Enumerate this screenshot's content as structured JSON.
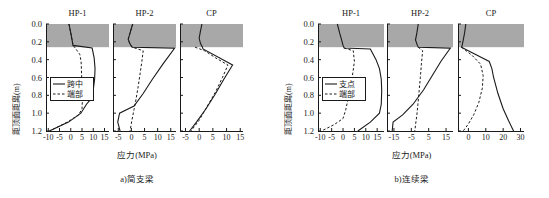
{
  "figure": {
    "ylabel": "距顶面距离(m)",
    "xlabel": "应力(MPa)",
    "y_ticks": [
      "0.0",
      "0.2",
      "0.4",
      "0.6",
      "0.8",
      "1.0",
      "1.2"
    ],
    "band_color": "#a8a8a8",
    "line_color": "#1a1a1a"
  },
  "groups": [
    {
      "caption": "a)简支梁",
      "legend": {
        "solid": "跨中",
        "dashed": "端部"
      },
      "panels": [
        {
          "title": "HP-1",
          "xticks": [
            "-10",
            "-5",
            "0",
            "5",
            "10",
            "15"
          ]
        },
        {
          "title": "HP-2",
          "xticks": [
            "-5",
            "0",
            "5",
            "10",
            "15"
          ]
        },
        {
          "title": "CP",
          "xticks": [
            "-5",
            "0",
            "5",
            "10",
            "15"
          ]
        }
      ]
    },
    {
      "caption": "b)连续梁",
      "legend": {
        "solid": "支点",
        "dashed": "端部"
      },
      "panels": [
        {
          "title": "HP-1",
          "xticks": [
            "-10",
            "-5",
            "0",
            "5",
            "10",
            "15"
          ]
        },
        {
          "title": "HP-2",
          "xticks": [
            "-15",
            "-5",
            "5",
            "15"
          ]
        },
        {
          "title": "CP",
          "xticks": [
            "0",
            "10",
            "20",
            "30"
          ]
        }
      ]
    }
  ],
  "chart_data": {
    "type": "line",
    "xlabel": "应力(MPa)",
    "ylabel": "距顶面距离(m)",
    "ylim": [
      0.0,
      1.2
    ],
    "y_axis_inverted": true,
    "grid": false,
    "shaded_band": {
      "label": "混凝土板",
      "y_from": 0.0,
      "y_to": 0.26,
      "color": "#a8a8a8"
    },
    "subplots": [
      {
        "group": "a)简支梁",
        "panel": "HP-1",
        "xlim": [
          -11,
          17
        ],
        "xticks": [
          -10,
          -5,
          0,
          5,
          10,
          15
        ],
        "series": [
          {
            "name": "跨中",
            "style": "solid",
            "points": [
              {
                "x": -0.8,
                "y": 0.0
              },
              {
                "x": 0.0,
                "y": 0.1
              },
              {
                "x": 0.6,
                "y": 0.18
              },
              {
                "x": 1.0,
                "y": 0.24
              },
              {
                "x": 9.5,
                "y": 0.27
              },
              {
                "x": 10.4,
                "y": 0.38
              },
              {
                "x": 10.8,
                "y": 0.5
              },
              {
                "x": 10.6,
                "y": 0.62
              },
              {
                "x": 10.0,
                "y": 0.74
              },
              {
                "x": 9.0,
                "y": 0.84
              },
              {
                "x": 7.0,
                "y": 0.9
              },
              {
                "x": 4.5,
                "y": 1.0
              },
              {
                "x": -1.0,
                "y": 1.1
              },
              {
                "x": -9.5,
                "y": 1.2
              }
            ]
          },
          {
            "name": "端部",
            "style": "dashed",
            "points": [
              {
                "x": -0.8,
                "y": 0.0
              },
              {
                "x": 0.0,
                "y": 0.1
              },
              {
                "x": 0.6,
                "y": 0.18
              },
              {
                "x": 1.0,
                "y": 0.24
              },
              {
                "x": 2.0,
                "y": 0.27
              },
              {
                "x": 4.0,
                "y": 0.34
              },
              {
                "x": 4.6,
                "y": 0.42
              },
              {
                "x": 4.8,
                "y": 0.55
              },
              {
                "x": 5.0,
                "y": 0.7
              },
              {
                "x": 5.2,
                "y": 0.85
              },
              {
                "x": 5.0,
                "y": 0.95
              },
              {
                "x": 3.5,
                "y": 1.02
              },
              {
                "x": -1.5,
                "y": 1.1
              },
              {
                "x": -9.5,
                "y": 1.2
              }
            ]
          }
        ]
      },
      {
        "group": "a)简支梁",
        "panel": "HP-2",
        "xlim": [
          -7,
          17
        ],
        "xticks": [
          -5,
          0,
          5,
          10,
          15
        ],
        "series": [
          {
            "name": "跨中",
            "style": "solid",
            "points": [
              {
                "x": 0.5,
                "y": 0.0
              },
              {
                "x": -0.5,
                "y": 0.1
              },
              {
                "x": -1.2,
                "y": 0.17
              },
              {
                "x": -0.6,
                "y": 0.22
              },
              {
                "x": 0.3,
                "y": 0.26
              },
              {
                "x": 16.5,
                "y": 0.27
              },
              {
                "x": 12.0,
                "y": 0.45
              },
              {
                "x": 8.0,
                "y": 0.62
              },
              {
                "x": 4.5,
                "y": 0.78
              },
              {
                "x": 1.0,
                "y": 0.92
              },
              {
                "x": -4.5,
                "y": 1.0
              },
              {
                "x": -5.2,
                "y": 1.1
              },
              {
                "x": -4.3,
                "y": 1.2
              }
            ]
          },
          {
            "name": "端部",
            "style": "dashed",
            "points": [
              {
                "x": 0.5,
                "y": 0.0
              },
              {
                "x": -0.5,
                "y": 0.1
              },
              {
                "x": -1.2,
                "y": 0.17
              },
              {
                "x": -0.6,
                "y": 0.22
              },
              {
                "x": 0.3,
                "y": 0.26
              },
              {
                "x": 4.5,
                "y": 0.3
              },
              {
                "x": 4.0,
                "y": 0.42
              },
              {
                "x": 3.3,
                "y": 0.56
              },
              {
                "x": 2.6,
                "y": 0.7
              },
              {
                "x": 1.8,
                "y": 0.84
              },
              {
                "x": 1.0,
                "y": 0.96
              },
              {
                "x": 0.2,
                "y": 1.08
              },
              {
                "x": -0.5,
                "y": 1.2
              }
            ]
          }
        ]
      },
      {
        "group": "a)简支梁",
        "panel": "CP",
        "xlim": [
          -7,
          16
        ],
        "xticks": [
          -5,
          0,
          5,
          10,
          15
        ],
        "series": [
          {
            "name": "跨中",
            "style": "solid",
            "points": [
              {
                "x": 1.0,
                "y": 0.0
              },
              {
                "x": 0.4,
                "y": 0.09
              },
              {
                "x": 0.0,
                "y": 0.16
              },
              {
                "x": 0.5,
                "y": 0.22
              },
              {
                "x": 1.2,
                "y": 0.26
              },
              {
                "x": 1.4,
                "y": 0.28
              },
              {
                "x": 12.2,
                "y": 0.46
              },
              {
                "x": 9.0,
                "y": 0.62
              },
              {
                "x": 6.0,
                "y": 0.78
              },
              {
                "x": 2.5,
                "y": 0.95
              },
              {
                "x": -1.0,
                "y": 1.1
              },
              {
                "x": -3.5,
                "y": 1.2
              }
            ]
          },
          {
            "name": "端部",
            "style": "dashed",
            "points": [
              {
                "x": -1.5,
                "y": 0.26
              },
              {
                "x": 2.0,
                "y": 0.3
              },
              {
                "x": 6.0,
                "y": 0.38
              },
              {
                "x": 10.5,
                "y": 0.46
              },
              {
                "x": 8.5,
                "y": 0.6
              },
              {
                "x": 6.0,
                "y": 0.76
              },
              {
                "x": 3.0,
                "y": 0.92
              },
              {
                "x": 0.0,
                "y": 1.08
              },
              {
                "x": -3.0,
                "y": 1.2
              }
            ]
          }
        ]
      },
      {
        "group": "b)连续梁",
        "panel": "HP-1",
        "xlim": [
          -11,
          18
        ],
        "xticks": [
          -10,
          -5,
          0,
          5,
          10,
          15
        ],
        "series": [
          {
            "name": "支点",
            "style": "solid",
            "points": [
              {
                "x": -2.5,
                "y": 0.0
              },
              {
                "x": -1.5,
                "y": 0.1
              },
              {
                "x": -0.6,
                "y": 0.18
              },
              {
                "x": 0.0,
                "y": 0.24
              },
              {
                "x": 0.5,
                "y": 0.27
              },
              {
                "x": 12.0,
                "y": 0.28
              },
              {
                "x": 14.5,
                "y": 0.4
              },
              {
                "x": 16.0,
                "y": 0.5
              },
              {
                "x": 16.8,
                "y": 0.62
              },
              {
                "x": 17.0,
                "y": 0.75
              },
              {
                "x": 16.8,
                "y": 0.9
              },
              {
                "x": 16.0,
                "y": 1.0
              },
              {
                "x": 12.0,
                "y": 1.1
              },
              {
                "x": 6.5,
                "y": 1.2
              }
            ]
          },
          {
            "name": "端部",
            "style": "dashed",
            "points": [
              {
                "x": 0.5,
                "y": 0.27
              },
              {
                "x": 4.5,
                "y": 0.3
              },
              {
                "x": 5.0,
                "y": 0.42
              },
              {
                "x": 4.3,
                "y": 0.55
              },
              {
                "x": 3.4,
                "y": 0.68
              },
              {
                "x": 2.4,
                "y": 0.82
              },
              {
                "x": 1.2,
                "y": 0.96
              },
              {
                "x": 0.0,
                "y": 1.06
              },
              {
                "x": -4.0,
                "y": 1.13
              },
              {
                "x": -9.5,
                "y": 1.2
              }
            ]
          }
        ]
      },
      {
        "group": "b)连续梁",
        "panel": "HP-2",
        "xlim": [
          -19,
          19
        ],
        "xticks": [
          -15,
          -5,
          5,
          15
        ],
        "series": [
          {
            "name": "支点",
            "style": "solid",
            "points": [
              {
                "x": -1.0,
                "y": 0.0
              },
              {
                "x": -1.8,
                "y": 0.1
              },
              {
                "x": -2.6,
                "y": 0.18
              },
              {
                "x": -1.5,
                "y": 0.24
              },
              {
                "x": -1.0,
                "y": 0.26
              },
              {
                "x": 17.5,
                "y": 0.27
              },
              {
                "x": 12.0,
                "y": 0.42
              },
              {
                "x": 7.0,
                "y": 0.58
              },
              {
                "x": 2.0,
                "y": 0.74
              },
              {
                "x": -4.0,
                "y": 0.9
              },
              {
                "x": -10.0,
                "y": 1.02
              },
              {
                "x": -15.5,
                "y": 1.1
              },
              {
                "x": -16.0,
                "y": 1.2
              }
            ]
          },
          {
            "name": "端部",
            "style": "dashed",
            "points": [
              {
                "x": -1.0,
                "y": 0.26
              },
              {
                "x": 1.5,
                "y": 0.3
              },
              {
                "x": 0.8,
                "y": 0.45
              },
              {
                "x": 0.2,
                "y": 0.6
              },
              {
                "x": -0.5,
                "y": 0.75
              },
              {
                "x": -1.2,
                "y": 0.9
              },
              {
                "x": -1.8,
                "y": 1.02
              },
              {
                "x": -2.5,
                "y": 1.12
              },
              {
                "x": -3.0,
                "y": 1.2
              }
            ]
          }
        ]
      },
      {
        "group": "b)连续梁",
        "panel": "CP",
        "xlim": [
          -6,
          32
        ],
        "xticks": [
          0,
          10,
          20,
          30
        ],
        "series": [
          {
            "name": "支点",
            "style": "solid",
            "points": [
              {
                "x": -1.5,
                "y": 0.0
              },
              {
                "x": -2.2,
                "y": 0.1
              },
              {
                "x": -3.0,
                "y": 0.18
              },
              {
                "x": -3.6,
                "y": 0.24
              },
              {
                "x": -4.0,
                "y": 0.26
              },
              {
                "x": 5.0,
                "y": 0.35
              },
              {
                "x": 12.0,
                "y": 0.42
              },
              {
                "x": 13.5,
                "y": 0.5
              },
              {
                "x": 14.5,
                "y": 0.6
              },
              {
                "x": 17.0,
                "y": 0.78
              },
              {
                "x": 20.0,
                "y": 0.95
              },
              {
                "x": 23.0,
                "y": 1.08
              },
              {
                "x": 26.0,
                "y": 1.2
              }
            ]
          },
          {
            "name": "端部",
            "style": "dashed",
            "points": [
              {
                "x": -4.0,
                "y": 0.26
              },
              {
                "x": 2.0,
                "y": 0.35
              },
              {
                "x": 7.0,
                "y": 0.45
              },
              {
                "x": 8.5,
                "y": 0.58
              },
              {
                "x": 8.0,
                "y": 0.72
              },
              {
                "x": 6.0,
                "y": 0.88
              },
              {
                "x": 3.0,
                "y": 1.02
              },
              {
                "x": 0.0,
                "y": 1.12
              },
              {
                "x": -3.0,
                "y": 1.2
              }
            ]
          }
        ]
      }
    ]
  }
}
